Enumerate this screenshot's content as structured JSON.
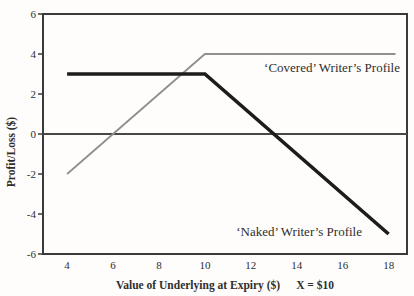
{
  "figure": {
    "background": "#fefdfb",
    "text_color": "#2e2e2e",
    "axis_color": "#3a3a3a",
    "zero_line_color": "#474747"
  },
  "chart_data": {
    "type": "line",
    "title": "",
    "xlabel": "Value of Underlying at Expiry ($)",
    "xlabel_note": "X = $10",
    "ylabel": "Profit/Loss ($)",
    "xlim": [
      2.95,
      18.8
    ],
    "ylim": [
      -6,
      6
    ],
    "xticks": [
      4,
      6,
      8,
      10,
      12,
      14,
      16,
      18
    ],
    "yticks": [
      6,
      4,
      2,
      0,
      -2,
      -4,
      -6
    ],
    "grid": false,
    "zero_line": true,
    "legend_position": "inline-annotations",
    "series": [
      {
        "name": "‘Covered’ Writer’s Profile",
        "points": [
          [
            4,
            -2
          ],
          [
            10,
            4
          ],
          [
            18.3,
            4
          ]
        ],
        "color": "#8f8f8f",
        "width": 1.8
      },
      {
        "name": "‘Naked’ Writer’s Profile",
        "points": [
          [
            4,
            3
          ],
          [
            10,
            3
          ],
          [
            18,
            -5
          ]
        ],
        "color": "#1c1c1c",
        "width": 3.6
      }
    ]
  }
}
